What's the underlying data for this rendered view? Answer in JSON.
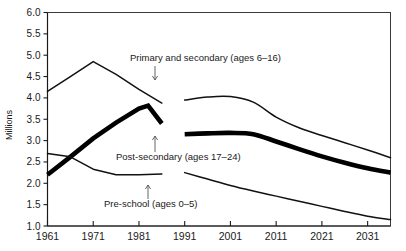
{
  "chart_data": {
    "type": "line",
    "title": "",
    "xlabel": "",
    "ylabel": "Millions",
    "xlim": [
      1961,
      2036
    ],
    "ylim": [
      1.0,
      6.0
    ],
    "grid": false,
    "legend": "inline-annotations",
    "x_ticks": [
      "1961",
      "1971",
      "1981",
      "1991",
      "2001",
      "2011",
      "2021",
      "2031"
    ],
    "y_ticks": [
      "1.0",
      "1.5",
      "2.0",
      "2.5",
      "3.0",
      "3.5",
      "4.0",
      "4.5",
      "5.0",
      "5.5",
      "6.0"
    ],
    "series": [
      {
        "name": "Primary and secondary (ages 6-16)",
        "style": "thin",
        "historical": {
          "x": [
            1961,
            1966,
            1971,
            1976,
            1981,
            1986
          ],
          "values": [
            4.15,
            4.5,
            4.85,
            4.55,
            4.2,
            3.88
          ]
        },
        "projected": {
          "x": [
            1991,
            1996,
            2001,
            2006,
            2011,
            2016,
            2021,
            2026,
            2031,
            2036
          ],
          "values": [
            3.95,
            4.02,
            4.03,
            3.9,
            3.55,
            3.3,
            3.12,
            2.95,
            2.78,
            2.6
          ]
        }
      },
      {
        "name": "Post-secondary (ages 17-24)",
        "style": "thick",
        "historical": {
          "x": [
            1961,
            1966,
            1971,
            1976,
            1981,
            1983,
            1986
          ],
          "values": [
            2.2,
            2.62,
            3.05,
            3.42,
            3.75,
            3.82,
            3.4
          ]
        },
        "projected": {
          "x": [
            1991,
            1996,
            2001,
            2006,
            2011,
            2016,
            2021,
            2026,
            2031,
            2036
          ],
          "values": [
            3.15,
            3.17,
            3.18,
            3.15,
            2.98,
            2.8,
            2.63,
            2.48,
            2.35,
            2.25
          ]
        }
      },
      {
        "name": "Pre-school (ages 0-5)",
        "style": "thin",
        "historical": {
          "x": [
            1961,
            1966,
            1971,
            1976,
            1981,
            1986
          ],
          "values": [
            2.7,
            2.62,
            2.33,
            2.2,
            2.2,
            2.22
          ]
        },
        "projected": {
          "x": [
            1991,
            1996,
            2001,
            2006,
            2011,
            2016,
            2021,
            2026,
            2031,
            2036
          ],
          "values": [
            2.25,
            2.1,
            1.95,
            1.82,
            1.7,
            1.58,
            1.46,
            1.34,
            1.23,
            1.15
          ]
        }
      }
    ],
    "annotations": [
      {
        "id": "primary",
        "text": "Primary and secondary (ages 6–16)",
        "text_x": 130,
        "text_y": 61,
        "arrow_x": 155,
        "arrow_y1": 66,
        "arrow_y2": 80
      },
      {
        "id": "postsecondary",
        "text": "Post-secondary (ages 17–24)",
        "text_x": 116,
        "text_y": 160,
        "arrow_x": 155,
        "arrow_y1": 152,
        "arrow_y2": 136
      },
      {
        "id": "preschool",
        "text": "Pre-school (ages 0–5)",
        "text_x": 104,
        "text_y": 207,
        "arrow_x": 148,
        "arrow_y1": 199,
        "arrow_y2": 185
      }
    ]
  },
  "axis": {
    "y_title": "Millions"
  }
}
